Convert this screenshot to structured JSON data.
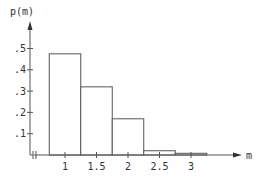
{
  "chart_data": {
    "type": "bar",
    "title": "",
    "xlabel": "m",
    "ylabel": "p(m)",
    "bins": [
      {
        "from": 0.75,
        "to": 1.25,
        "value": 0.475
      },
      {
        "from": 1.25,
        "to": 1.75,
        "value": 0.32
      },
      {
        "from": 1.75,
        "to": 2.25,
        "value": 0.17
      },
      {
        "from": 2.25,
        "to": 2.75,
        "value": 0.02
      },
      {
        "from": 2.75,
        "to": 3.25,
        "value": 0.008
      }
    ],
    "x_ticks": [
      1,
      1.5,
      2,
      2.5,
      3
    ],
    "x_tick_labels": [
      "1",
      "1.5",
      "2",
      "2.5",
      "3"
    ],
    "y_ticks": [
      0.1,
      0.2,
      0.3,
      0.4,
      0.5
    ],
    "y_tick_labels": [
      ".1",
      ".2",
      ".3",
      ".4",
      ".5"
    ],
    "xlim": [
      0.5,
      3.8
    ],
    "ylim": [
      0,
      0.6
    ],
    "x_axis_break": true,
    "grid": false,
    "legend": "none"
  }
}
